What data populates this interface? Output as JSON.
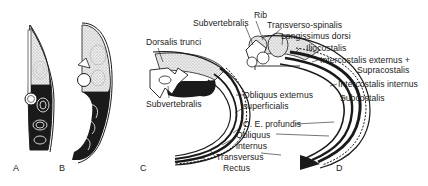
{
  "figure": {
    "panels": [
      {
        "id": "A",
        "label": "A"
      },
      {
        "id": "B",
        "label": "B"
      },
      {
        "id": "C",
        "label": "C"
      },
      {
        "id": "D",
        "label": "D"
      }
    ],
    "labels_C": {
      "dorsalis_trunci": "Dorsalis trunci",
      "subvertebralis": "Subvertebralis",
      "obliquus_externus_superficialis_1": "Obliquus externus",
      "obliquus_externus_superficialis_2": "superficialis",
      "oe_profundis": "O. E. profundis",
      "obliquus_internus_1": "Obliquus",
      "obliquus_internus_2": "internus",
      "transversus": "Transversus",
      "rectus": "Rectus"
    },
    "labels_D": {
      "rib": "Rib",
      "subvertebralis": "Subvertebralis",
      "transverso_spinalis": "Transverso-spinalis",
      "longissimus_dorsi": "Longissimus dorsi",
      "iliocostalis": "Iliocostalis",
      "intercostalis_externus_1": "Intercostalis externus +",
      "intercostalis_externus_2": "Supracostalis",
      "intercostalis_internus": "Intercostalis internus",
      "subcostalis": "Subcostalis"
    },
    "colors": {
      "ink": "#1a1a1a",
      "stipple": "#d8d8d8",
      "background": "#ffffff"
    }
  }
}
